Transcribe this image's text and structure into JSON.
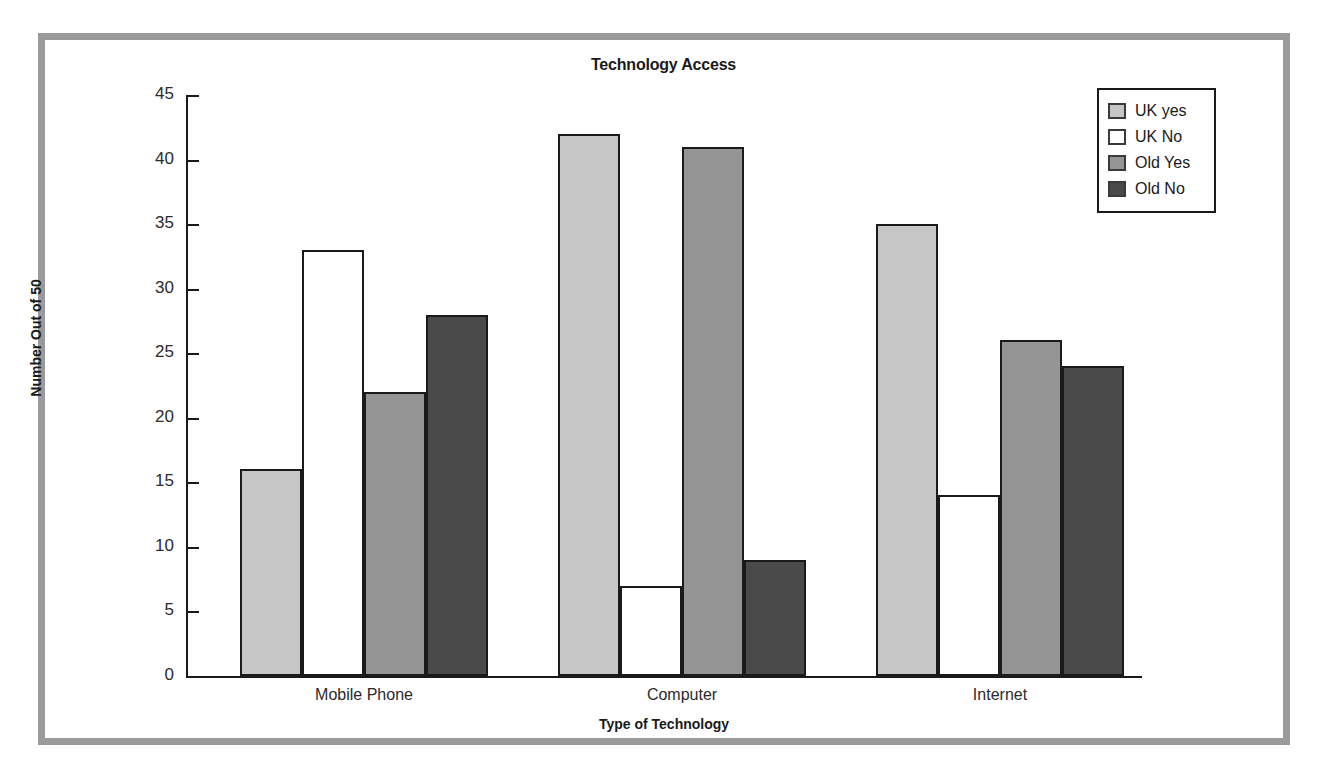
{
  "frame": {
    "border_color": "#9a9a9a"
  },
  "chart_data": {
    "type": "bar",
    "title": "Technology Access",
    "xlabel": "Type of Technology",
    "ylabel": "Number Out of 50",
    "ylim": [
      0,
      45
    ],
    "yticks": [
      0,
      5,
      10,
      15,
      20,
      25,
      30,
      35,
      40,
      45
    ],
    "ytick_labels": [
      "0",
      "5",
      "10",
      "15",
      "20",
      "25",
      "30",
      "35",
      "40",
      "45"
    ],
    "grid": false,
    "legend_position": "top-right",
    "categories": [
      "Mobile Phone",
      "Computer",
      "Internet"
    ],
    "series": [
      {
        "name": "UK yes",
        "color": "#c6c6c6",
        "values": [
          16,
          42,
          35
        ]
      },
      {
        "name": "UK No",
        "color": "#ffffff",
        "values": [
          33,
          7,
          14
        ]
      },
      {
        "name": "Old Yes",
        "color": "#959595",
        "values": [
          22,
          41,
          26
        ]
      },
      {
        "name": "Old No",
        "color": "#4a4a4a",
        "values": [
          28,
          9,
          24
        ]
      }
    ]
  }
}
